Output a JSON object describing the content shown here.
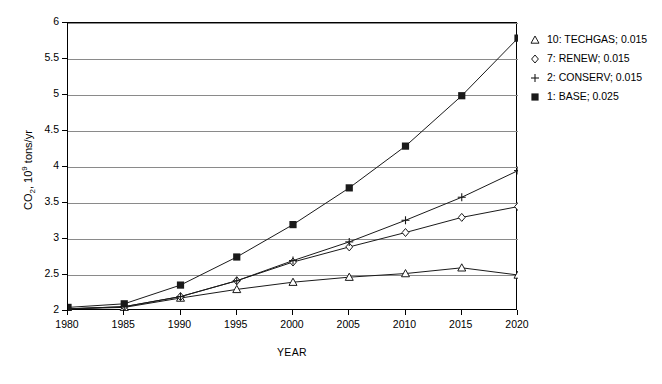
{
  "chart_data": {
    "type": "line",
    "title": "",
    "xlabel": "YEAR",
    "ylabel": "CO2, 10^9 tons/yr",
    "ylabel_parts": {
      "prefix": "CO",
      "sub": "2",
      "mid": ", 10",
      "sup": "9",
      "suffix": " tons/yr"
    },
    "x": [
      1980,
      1985,
      1990,
      1995,
      2000,
      2005,
      2010,
      2015,
      2020
    ],
    "categories": [
      "1980",
      "1985",
      "1990",
      "1995",
      "2000",
      "2005",
      "2010",
      "2015",
      "2020"
    ],
    "xlim": [
      1980,
      2020
    ],
    "ylim": [
      2,
      6
    ],
    "yticks": [
      2,
      2.5,
      3,
      3.5,
      4,
      4.5,
      5,
      5.5,
      6
    ],
    "ytick_labels": [
      "2",
      "2.5",
      "3",
      "3.5",
      "4",
      "4.5",
      "5",
      "5.5",
      "6"
    ],
    "grid": "horizontal",
    "legend_position": "right-top",
    "series": [
      {
        "name": "10: TECHGAS; 0.015",
        "label": "10: TECHGAS",
        "growth": "0.015",
        "marker": "triangle-open",
        "values": [
          2.03,
          2.05,
          2.18,
          2.3,
          2.4,
          2.47,
          2.52,
          2.6,
          2.5
        ]
      },
      {
        "name": "7: RENEW; 0.015",
        "label": "7: RENEW",
        "growth": "0.015",
        "marker": "diamond-open",
        "values": [
          2.03,
          2.06,
          2.2,
          2.42,
          2.68,
          2.89,
          3.09,
          3.3,
          3.45
        ]
      },
      {
        "name": "2: CONSERV; 0.015",
        "label": "2: CONSERV",
        "growth": "0.015",
        "marker": "plus",
        "values": [
          2.03,
          2.06,
          2.2,
          2.42,
          2.7,
          2.96,
          3.26,
          3.58,
          3.95
        ]
      },
      {
        "name": "1: BASE; 0.025",
        "label": "1: BASE",
        "growth": "0.025",
        "marker": "square-filled",
        "values": [
          2.05,
          2.1,
          2.36,
          2.75,
          3.2,
          3.71,
          4.29,
          4.99,
          5.79
        ]
      }
    ]
  },
  "legend": {
    "entries": [
      {
        "marker": "triangle-open-icon",
        "text": "10: TECHGAS; 0.015"
      },
      {
        "marker": "diamond-open-icon",
        "text": "7: RENEW; 0.015"
      },
      {
        "marker": "plus-icon",
        "text": "2: CONSERV; 0.015"
      },
      {
        "marker": "square-filled-icon",
        "text": "1: BASE; 0.025"
      }
    ]
  },
  "colors": {
    "line": "#1a1a1a",
    "grid": "#8a8a8a",
    "axis": "#000000",
    "background": "#ffffff"
  }
}
